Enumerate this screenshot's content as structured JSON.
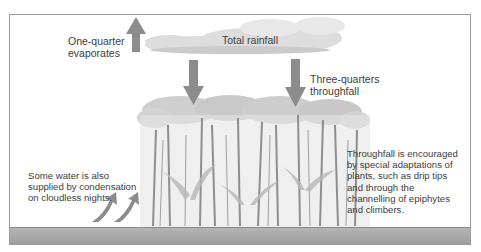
{
  "diagram": {
    "labels": {
      "evaporation": "One-quarter\nevaporates",
      "rainfall": "Total rainfall",
      "throughfall": "Three-quarters\nthroughfall",
      "condensation": "Some water is also\nsupplied by condensation\non cloudless nights.",
      "adaptations": "Throughfall is encouraged\nby special adaptations of\nplants, such as drip tips\nand through the\nchannelling of epiphytes\nand climbers."
    },
    "arrows": [
      {
        "name": "evaporation-arrow",
        "direction": "up"
      },
      {
        "name": "throughfall-arrow-left",
        "direction": "down"
      },
      {
        "name": "throughfall-arrow-right",
        "direction": "down"
      },
      {
        "name": "condensation-arrow-1",
        "direction": "up-right"
      },
      {
        "name": "condensation-arrow-2",
        "direction": "up-right"
      }
    ],
    "colors": {
      "arrow": "#8c8c8c",
      "cloud": "#d8d8d8",
      "ground": "#a8a8a8",
      "canopy": "#bdbdbd",
      "trunk": "#8a8a8a",
      "frame": "#9a9a9a",
      "text": "#3d3d3d"
    }
  }
}
